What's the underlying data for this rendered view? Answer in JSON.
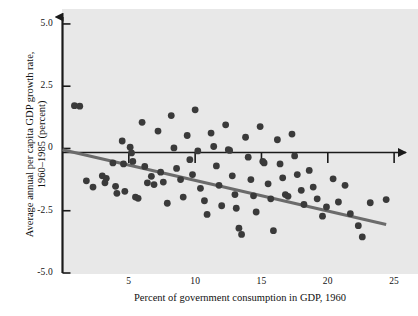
{
  "chart_data": {
    "type": "scatter",
    "title": "",
    "xlabel": "Percent of government consumption in GDP, 1960",
    "ylabel_line1": "Average annual per capita GDP growth rate,",
    "ylabel_line2": "1960–1985 (percent)",
    "xlim": [
      0,
      26.8
    ],
    "ylim": [
      -5.0,
      5.6
    ],
    "xticks": [
      5,
      10,
      15,
      20,
      25
    ],
    "xtick_labels": [
      "5",
      "10",
      "15",
      "20",
      "25"
    ],
    "yticks": [
      5.0,
      2.5,
      0,
      -2.5,
      -5.0
    ],
    "ytick_labels": [
      "5.0",
      "2.5",
      "0",
      "-2.5",
      "-5.0"
    ],
    "grid": false,
    "legend": null,
    "plot_bgcolor": "#e8e8e8",
    "marker_color": "#3a3a3a",
    "trendline_color": "#6b6b6b",
    "axis_color": "#1a1a1a",
    "marker_size": 3.4,
    "trendline": {
      "label": "fitted regression line",
      "x_start": 0.0,
      "y_start": -0.05,
      "x_end": 24.4,
      "y_end": -3.05
    },
    "points": [
      [
        0.9,
        1.72
      ],
      [
        1.3,
        1.7
      ],
      [
        1.8,
        -1.3
      ],
      [
        2.3,
        -1.55
      ],
      [
        3.0,
        -1.1
      ],
      [
        3.2,
        -1.38
      ],
      [
        3.3,
        -1.2
      ],
      [
        3.8,
        -0.58
      ],
      [
        4.0,
        -1.52
      ],
      [
        4.1,
        -1.8
      ],
      [
        4.5,
        0.3
      ],
      [
        4.6,
        -0.62
      ],
      [
        4.7,
        -1.72
      ],
      [
        5.1,
        0.05
      ],
      [
        5.2,
        -0.18
      ],
      [
        5.3,
        -0.52
      ],
      [
        5.5,
        -1.95
      ],
      [
        5.7,
        -2.0
      ],
      [
        6.0,
        1.05
      ],
      [
        6.2,
        -0.72
      ],
      [
        6.4,
        -1.38
      ],
      [
        6.7,
        -1.12
      ],
      [
        6.9,
        -1.45
      ],
      [
        7.2,
        0.7
      ],
      [
        7.4,
        -0.95
      ],
      [
        7.6,
        -1.35
      ],
      [
        7.9,
        -2.2
      ],
      [
        8.2,
        1.32
      ],
      [
        8.4,
        0.02
      ],
      [
        8.6,
        -0.8
      ],
      [
        8.9,
        -1.25
      ],
      [
        9.1,
        -1.95
      ],
      [
        9.4,
        0.52
      ],
      [
        9.6,
        -0.45
      ],
      [
        9.8,
        -1.05
      ],
      [
        10.0,
        1.55
      ],
      [
        10.2,
        -0.1
      ],
      [
        10.4,
        -1.6
      ],
      [
        10.7,
        -2.1
      ],
      [
        10.9,
        -2.65
      ],
      [
        11.2,
        0.62
      ],
      [
        11.4,
        0.08
      ],
      [
        11.6,
        -0.7
      ],
      [
        11.8,
        -1.48
      ],
      [
        12.0,
        -2.3
      ],
      [
        12.3,
        0.95
      ],
      [
        12.5,
        -0.05
      ],
      [
        12.6,
        -0.08
      ],
      [
        12.8,
        -1.1
      ],
      [
        13.0,
        -1.85
      ],
      [
        13.1,
        -2.4
      ],
      [
        13.3,
        -3.2
      ],
      [
        13.5,
        -3.45
      ],
      [
        13.8,
        0.45
      ],
      [
        14.0,
        -0.35
      ],
      [
        14.2,
        -1.25
      ],
      [
        14.4,
        -1.9
      ],
      [
        14.6,
        -2.55
      ],
      [
        14.9,
        0.88
      ],
      [
        15.1,
        -0.52
      ],
      [
        15.2,
        -0.58
      ],
      [
        15.5,
        -1.42
      ],
      [
        15.7,
        -2.02
      ],
      [
        15.9,
        -3.3
      ],
      [
        16.2,
        0.35
      ],
      [
        16.4,
        -0.62
      ],
      [
        16.6,
        -1.18
      ],
      [
        16.8,
        -1.85
      ],
      [
        17.0,
        -1.92
      ],
      [
        17.3,
        0.58
      ],
      [
        17.5,
        -0.3
      ],
      [
        17.7,
        -1.05
      ],
      [
        18.0,
        -1.68
      ],
      [
        18.2,
        -2.25
      ],
      [
        18.6,
        -0.88
      ],
      [
        18.9,
        -1.55
      ],
      [
        19.2,
        -2.02
      ],
      [
        19.6,
        -2.72
      ],
      [
        19.9,
        -2.35
      ],
      [
        20.4,
        -1.22
      ],
      [
        20.8,
        -2.15
      ],
      [
        21.3,
        -1.48
      ],
      [
        21.7,
        -2.62
      ],
      [
        22.3,
        -3.1
      ],
      [
        22.6,
        -3.55
      ],
      [
        23.2,
        -2.18
      ],
      [
        24.4,
        -2.05
      ]
    ]
  }
}
